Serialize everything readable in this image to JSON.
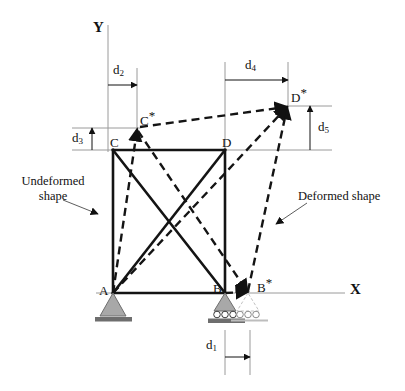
{
  "figure": {
    "axes": {
      "y_label": "Y",
      "x_label": "X"
    },
    "nodes": [
      {
        "id": "A",
        "label": "A",
        "star": false,
        "x": 113,
        "y": 293,
        "support": "pin"
      },
      {
        "id": "B",
        "label": "B",
        "star": false,
        "x": 225,
        "y": 293,
        "support": "roller"
      },
      {
        "id": "C",
        "label": "C",
        "star": false,
        "x": 113,
        "y": 150,
        "support": "none"
      },
      {
        "id": "D",
        "label": "D",
        "star": false,
        "x": 225,
        "y": 150,
        "support": "none"
      },
      {
        "id": "Bs",
        "label": "B",
        "star": true,
        "x": 248,
        "y": 293,
        "support": "roller-displaced"
      },
      {
        "id": "Cs",
        "label": "C",
        "star": true,
        "x": 137,
        "y": 128,
        "support": "none"
      },
      {
        "id": "Ds",
        "label": "D",
        "star": true,
        "x": 288,
        "y": 106,
        "support": "none"
      }
    ],
    "undeformed_members": [
      {
        "from": "A",
        "to": "B"
      },
      {
        "from": "A",
        "to": "C"
      },
      {
        "from": "B",
        "to": "D"
      },
      {
        "from": "C",
        "to": "D"
      },
      {
        "from": "A",
        "to": "D"
      },
      {
        "from": "B",
        "to": "C"
      }
    ],
    "deformed_members": [
      {
        "from": "A",
        "to": "Bs"
      },
      {
        "from": "A",
        "to": "Cs"
      },
      {
        "from": "Bs",
        "to": "Ds"
      },
      {
        "from": "Cs",
        "to": "Ds"
      },
      {
        "from": "A",
        "to": "Ds"
      },
      {
        "from": "Bs",
        "to": "Cs"
      }
    ],
    "dimensions": [
      {
        "id": "d1",
        "label": "d",
        "sub": "1",
        "orientation": "horizontal",
        "from_label": "B",
        "to_label": "B*"
      },
      {
        "id": "d2",
        "label": "d",
        "sub": "2",
        "orientation": "horizontal",
        "from_label": "Y-axis",
        "to_label": "C*"
      },
      {
        "id": "d3",
        "label": "d",
        "sub": "3",
        "orientation": "vertical",
        "from_label": "C",
        "to_label": "C*"
      },
      {
        "id": "d4",
        "label": "d",
        "sub": "4",
        "orientation": "horizontal",
        "from_label": "D",
        "to_label": "D*"
      },
      {
        "id": "d5",
        "label": "d",
        "sub": "5",
        "orientation": "vertical",
        "from_label": "D",
        "to_label": "D*"
      }
    ],
    "annotations": [
      {
        "id": "undeformed",
        "line1": "Undeformed",
        "line2": "shape"
      },
      {
        "id": "deformed",
        "line1": "Deformed shape",
        "line2": ""
      }
    ],
    "colors": {
      "member": "#1a1a1a",
      "deformed": "#1a1a1a",
      "reference_line": "#9a9a9a",
      "support_fill": "#a8a8a8",
      "support_base": "#6e6e6e",
      "ghost": "#bdbdbd",
      "background": "#ffffff"
    }
  }
}
